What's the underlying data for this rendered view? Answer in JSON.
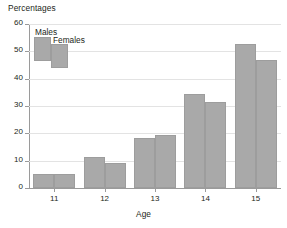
{
  "chart_data": {
    "type": "bar",
    "title": "Percentages",
    "xlabel": "Age",
    "ylabel": "",
    "categories": [
      "11",
      "12",
      "13",
      "14",
      "15"
    ],
    "series": [
      {
        "name": "Males",
        "values": [
          5.0,
          11.2,
          18.3,
          34.3,
          52.7
        ]
      },
      {
        "name": "Females",
        "values": [
          5.0,
          9.2,
          19.3,
          31.5,
          46.7
        ]
      }
    ],
    "ylim": [
      0,
      60
    ],
    "yticks": [
      0,
      10,
      20,
      30,
      40,
      50,
      60
    ],
    "ytick_labels": [
      "0",
      "10",
      "20",
      "30",
      "40",
      "50",
      "60"
    ],
    "grid": true,
    "legend_position": "top-left",
    "bar_color": "#a9a9a9",
    "grid_color": "#e3e3e3",
    "axis_color": "#9a9a9a",
    "text_color": "#231f20"
  },
  "legend": {
    "males_label": "Males",
    "females_label": "Females"
  }
}
